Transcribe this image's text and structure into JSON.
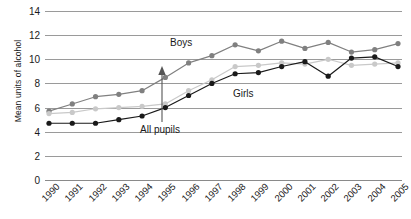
{
  "chart_data": {
    "type": "line",
    "title": "",
    "xlabel": "",
    "ylabel": "Mean units of alcohol",
    "ylim": [
      0,
      14
    ],
    "ytick_step": 2,
    "yticks": [
      14,
      12,
      10,
      8,
      6,
      4,
      2,
      0
    ],
    "grid": true,
    "legend_position": "inline-annotations",
    "categories": [
      "1990",
      "1991",
      "1992",
      "1993",
      "1994",
      "1995",
      "1996",
      "1997",
      "1998",
      "1999",
      "2000",
      "2001",
      "2002",
      "2003",
      "2004",
      "2005"
    ],
    "series": [
      {
        "name": "Boys",
        "color": "#808080",
        "values": [
          5.7,
          6.3,
          6.9,
          7.1,
          7.4,
          8.5,
          9.7,
          10.3,
          11.2,
          10.7,
          11.5,
          10.9,
          11.4,
          10.6,
          10.8,
          11.3
        ]
      },
      {
        "name": "Girls",
        "color": "#c9c9c9",
        "values": [
          5.5,
          5.6,
          5.9,
          6.0,
          6.1,
          6.3,
          7.4,
          8.3,
          9.4,
          9.5,
          9.7,
          9.6,
          10.0,
          9.5,
          9.6,
          9.7
        ]
      },
      {
        "name": "All pupils",
        "color": "#1a1a1a",
        "values": [
          4.7,
          4.7,
          4.7,
          5.0,
          5.3,
          6.0,
          7.0,
          8.0,
          8.8,
          8.9,
          9.4,
          9.8,
          8.6,
          10.1,
          10.2,
          9.4
        ]
      }
    ],
    "annotations": [
      {
        "name": "boys-label",
        "text": "Boys"
      },
      {
        "name": "girls-label",
        "text": "Girls"
      },
      {
        "name": "all-pupils-label",
        "text": "All pupils",
        "has_arrow": true
      }
    ]
  },
  "axes": {
    "y_title": "Mean units of alcohol"
  },
  "colors": {
    "boys": "#808080",
    "girls": "#c9c9c9",
    "all_pupils": "#1a1a1a",
    "grid": "#9a9a9a",
    "text": "#1a1a1a",
    "background": "#ffffff"
  }
}
